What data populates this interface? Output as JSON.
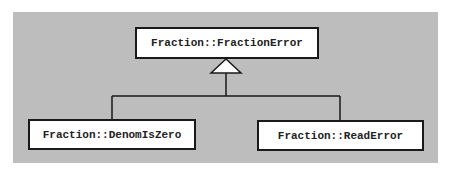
{
  "diagram": {
    "type": "class-inheritance",
    "base_class": {
      "label": "Fraction::FractionError"
    },
    "derived_classes": [
      {
        "label": "Fraction::DenomIsZero"
      },
      {
        "label": "Fraction::ReadError"
      }
    ],
    "relation": "generalization",
    "colors": {
      "background": "#bdbdbd",
      "box_fill": "#ffffff",
      "stroke": "#1a1a1a"
    }
  }
}
